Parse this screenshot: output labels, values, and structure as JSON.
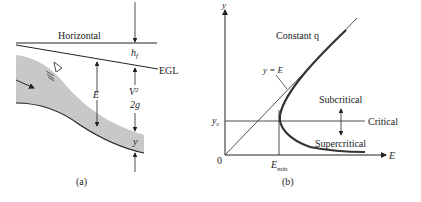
{
  "panel_a": {
    "caption": "(a)",
    "labels": {
      "horizontal": "Horizontal",
      "hf": "h",
      "hf_sub": "f",
      "egl": "EGL",
      "E": "E",
      "v2": "V²",
      "twog": "2g",
      "y": "y"
    }
  },
  "panel_b": {
    "caption": "(b)",
    "labels": {
      "y_axis": "y",
      "x_axis": "E",
      "origin": "0",
      "yc": "y",
      "yc_sub": "c",
      "emin": "E",
      "emin_sub": "min",
      "constant_q": "Constant q",
      "y_eq_E": "y = E",
      "subcritical": "Subcritical",
      "critical": "Critical",
      "supercritical": "Supercritical"
    }
  },
  "colors": {
    "line": "#222222",
    "water": "#c8c8c8"
  }
}
